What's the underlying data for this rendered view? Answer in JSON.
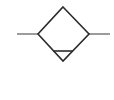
{
  "symbol": {
    "name": "filter-with-separator",
    "stroke_color": "#2b2b2b",
    "line_color": "#5a5a5a",
    "background": "#ffffff",
    "diamond": {
      "top": [
        63,
        7
      ],
      "right": [
        89,
        34
      ],
      "bottom": [
        63,
        61
      ],
      "left": [
        38,
        34
      ]
    },
    "inlet_line": {
      "x1": 17,
      "y1": 34,
      "x2": 38,
      "y2": 34
    },
    "outlet_line": {
      "x1": 89,
      "y1": 34,
      "x2": 110,
      "y2": 34
    },
    "separator_line": {
      "x1": 53,
      "y1": 51,
      "x2": 73,
      "y2": 51
    }
  }
}
